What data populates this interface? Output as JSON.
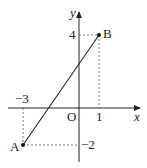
{
  "diagram": {
    "axes": {
      "x_label": "x",
      "y_label": "y",
      "origin_label": "O"
    },
    "points": [
      {
        "name": "A",
        "x": -3,
        "y": -2
      },
      {
        "name": "B",
        "x": 1,
        "y": 4
      }
    ],
    "tick_labels": {
      "x_neg3": "−3",
      "x_1": "1",
      "y_4": "4",
      "y_neg2": "−2"
    },
    "segment": "AB",
    "colors": {
      "line": "#222222",
      "dashed": "#555555",
      "background": "#ffffff"
    }
  }
}
